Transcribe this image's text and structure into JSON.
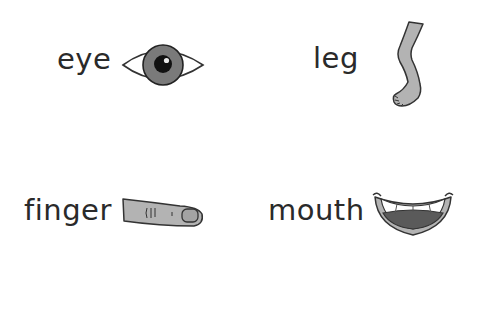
{
  "worksheet": {
    "items": [
      {
        "label": "eye",
        "icon": "eye-icon"
      },
      {
        "label": "leg",
        "icon": "leg-icon"
      },
      {
        "label": "finger",
        "icon": "finger-icon"
      },
      {
        "label": "mouth",
        "icon": "mouth-icon"
      }
    ]
  },
  "colors": {
    "text": "#2a2a2a",
    "outline": "#333333",
    "fill_mid_gray": "#7a7a7a",
    "fill_light_gray": "#b3b3b3",
    "fill_dark_gray": "#5a5a5a",
    "pupil": "#111111",
    "background": "#ffffff"
  }
}
